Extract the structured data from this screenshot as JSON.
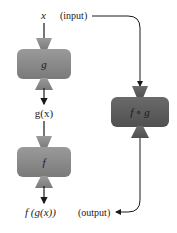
{
  "diagram": {
    "input_var": "x",
    "input_label": "(input)",
    "output_label": "(output)",
    "intermediate_label": "g(x)",
    "final_label": "f (g(x))",
    "boxes": [
      {
        "name": "g",
        "label": "g",
        "color": "#8a8a8a"
      },
      {
        "name": "f",
        "label": "f",
        "color": "#7e7e7e"
      },
      {
        "name": "composite",
        "label": "f ∘ g",
        "color": "#5e5e5e"
      }
    ],
    "arrow_color": "#1a1a1a"
  }
}
